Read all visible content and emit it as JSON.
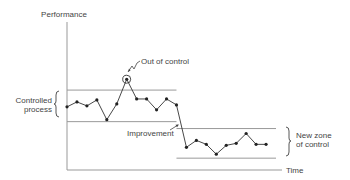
{
  "diagram": {
    "y_axis_label": "Performance",
    "x_axis_label": "Time",
    "annotations": {
      "out_of_control": "Out of control",
      "improvement": "Improvement",
      "controlled_process_line1": "Controlled",
      "controlled_process_line2": "process",
      "new_zone_line1": "New zone",
      "new_zone_line2": "of control"
    },
    "colors": {
      "axis": "#999999",
      "series": "#333333",
      "text": "#444444"
    }
  },
  "chart_data": {
    "type": "line",
    "title": "",
    "xlabel": "Time",
    "ylabel": "Performance",
    "xlim": [
      0,
      21
    ],
    "ylim": [
      0,
      15
    ],
    "controlled_process": {
      "upper_limit": 8.1,
      "lower_limit": 4.9,
      "x_range": [
        0,
        11
      ]
    },
    "new_zone_of_control": {
      "upper_limit": 4.2,
      "lower_limit": 1.2,
      "x_range": [
        11,
        21
      ]
    },
    "series": [
      {
        "name": "Performance",
        "x": [
          0,
          1,
          2,
          3,
          4,
          5,
          6,
          7,
          8,
          9,
          10,
          11,
          12,
          13,
          14,
          15,
          16,
          17,
          18,
          19,
          20
        ],
        "values": [
          6.4,
          6.9,
          6.5,
          7.1,
          5.1,
          6.7,
          9.2,
          7.2,
          7.2,
          6.1,
          7.2,
          6.6,
          2.3,
          3.0,
          2.6,
          1.6,
          2.5,
          2.7,
          3.7,
          2.6,
          2.6
        ]
      }
    ],
    "out_of_control_index": 6,
    "improvement_index": 12
  }
}
